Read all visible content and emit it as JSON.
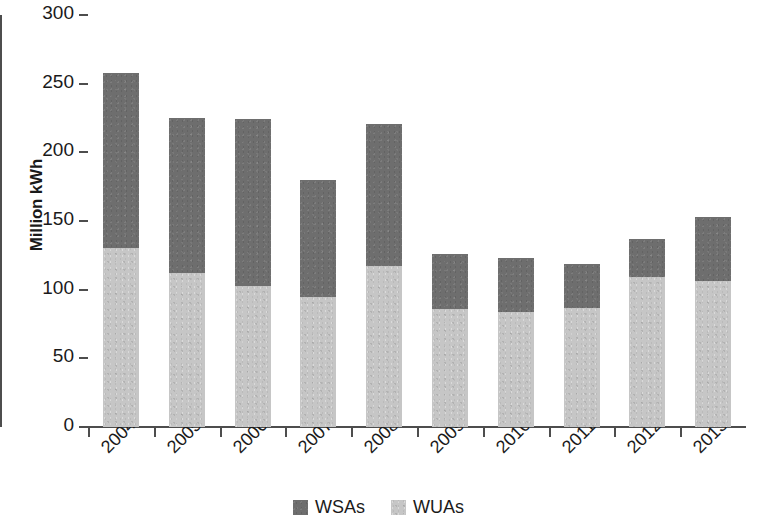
{
  "chart_data": {
    "type": "bar",
    "subtype": "stacked-vertical",
    "title": "",
    "subtitle": "",
    "xlabel": "",
    "ylabel": "Million kWh",
    "ylim": [
      0,
      300
    ],
    "yticks": [
      0,
      50,
      100,
      150,
      200,
      250,
      300
    ],
    "ytick_labels": [
      "0",
      "50",
      "100",
      "150",
      "200",
      "250",
      "300"
    ],
    "grid": false,
    "legend_position": "bottom-center",
    "categories": [
      "2004",
      "2005",
      "2006",
      "2007",
      "2008",
      "2009",
      "2010",
      "2011",
      "2012",
      "2013"
    ],
    "series": [
      {
        "name": "WUAs",
        "color": "#c6c6c6",
        "stack_order": 1,
        "values": [
          130,
          112,
          103,
          95,
          117,
          86,
          84,
          87,
          109,
          106
        ]
      },
      {
        "name": "WSAs",
        "color": "#6e6e6e",
        "stack_order": 2,
        "values": [
          128,
          113,
          121,
          85,
          104,
          40,
          39,
          32,
          28,
          47
        ]
      }
    ],
    "totals": [
      258,
      225,
      224,
      180,
      221,
      126,
      123,
      119,
      137,
      153
    ]
  },
  "legend": {
    "entries": [
      {
        "label": "WSAs",
        "color": "#6e6e6e",
        "swatch": "square-swatch-dark"
      },
      {
        "label": "WUAs",
        "color": "#c6c6c6",
        "swatch": "square-swatch-light"
      }
    ]
  },
  "colors": {
    "wsa": "#6e6e6e",
    "wua": "#c6c6c6",
    "axis": "#4d4d4d",
    "text": "#1a1a1a",
    "background": "#ffffff"
  }
}
